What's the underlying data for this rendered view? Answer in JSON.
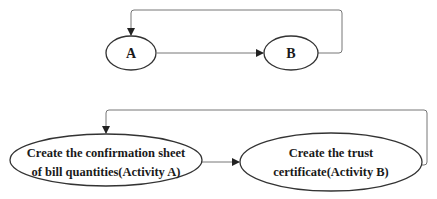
{
  "diagram": {
    "top": {
      "nodes": [
        {
          "id": "A",
          "label": "A"
        },
        {
          "id": "B",
          "label": "B"
        }
      ],
      "edges": [
        {
          "from": "A",
          "to": "B",
          "type": "forward"
        },
        {
          "from": "B",
          "to": "A",
          "type": "loop-back"
        }
      ]
    },
    "bottom": {
      "nodes": [
        {
          "id": "activity-a",
          "lines": [
            "Create the confirmation sheet",
            "of bill quantities(Activity A)"
          ]
        },
        {
          "id": "activity-b",
          "lines": [
            "Create the trust",
            "certificate(Activity B)"
          ]
        }
      ],
      "edges": [
        {
          "from": "activity-a",
          "to": "activity-b",
          "type": "forward"
        },
        {
          "from": "activity-b",
          "to": "activity-a",
          "type": "loop-back"
        }
      ]
    },
    "colors": {
      "stroke": "#333333",
      "edge": "#666666",
      "text": "#1a1a1a",
      "background": "#ffffff"
    }
  }
}
